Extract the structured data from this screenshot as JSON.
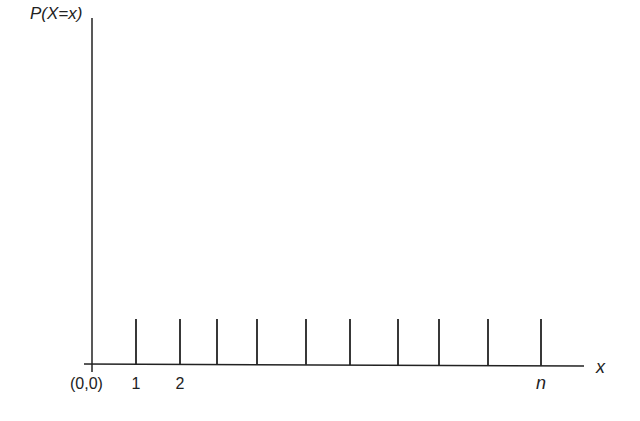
{
  "chart_data": {
    "type": "bar",
    "subtype": "stem",
    "title": "",
    "ylabel": "P(X=x)",
    "xlabel": "x",
    "origin_label": "(0,0)",
    "tick_labels": [
      {
        "x_index": 0,
        "label": "1"
      },
      {
        "x_index": 1,
        "label": "2"
      },
      {
        "x_index": 9,
        "label": "n"
      }
    ],
    "categories": [
      "1",
      "2",
      "",
      "",
      "",
      "",
      "",
      "",
      "",
      "n"
    ],
    "values": [
      1,
      1,
      1,
      1,
      1,
      1,
      1,
      1,
      1,
      1
    ],
    "note": "Uniform discrete distribution: equal probability 1/n at each of n points",
    "grid": false,
    "legend": null
  },
  "layout": {
    "origin": {
      "x": 92,
      "y": 364
    },
    "y_axis_top": 18,
    "y_axis_bottom": 372,
    "x_axis_left": 84,
    "x_axis_right": 584,
    "stem_top": 319,
    "stem_x": [
      136,
      180,
      217,
      257,
      306,
      350,
      398,
      439,
      488,
      541
    ],
    "line_color": "#222222"
  }
}
